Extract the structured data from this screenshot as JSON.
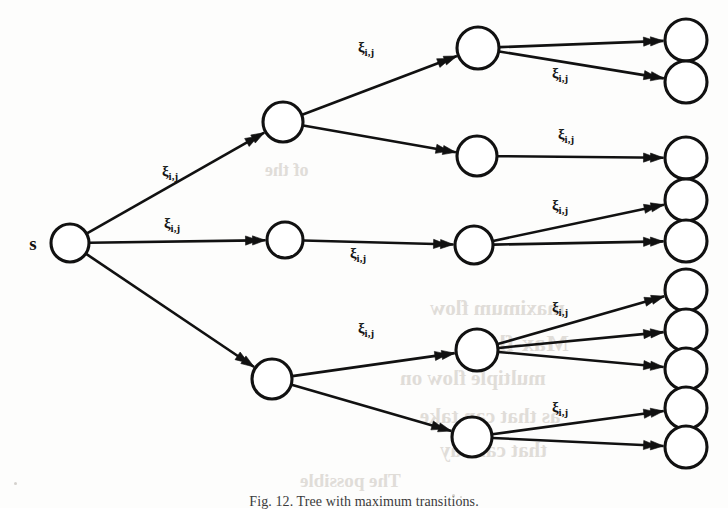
{
  "figure": {
    "kind": "directed-tree-diagram",
    "caption": "Fig. 12. Tree with maximum transitions.",
    "source_label": "s",
    "edge_label_base": "ξ",
    "edge_label_subscript": "i,j",
    "ink_color": "#111111",
    "background_color": "#fdfdfc",
    "node_fill": "#ffffff"
  },
  "graph": {
    "levels": [
      {
        "name": "source",
        "node_count": 1
      },
      {
        "name": "level-1",
        "node_count": 3
      },
      {
        "name": "level-2",
        "node_count": 5
      },
      {
        "name": "leaves",
        "node_count": 9
      }
    ],
    "nodes": [
      {
        "id": "s",
        "level": 0,
        "cx": 70,
        "cy": 243,
        "r": 19
      },
      {
        "id": "a1",
        "level": 1,
        "cx": 283,
        "cy": 122,
        "r": 20
      },
      {
        "id": "a2",
        "level": 1,
        "cx": 285,
        "cy": 240,
        "r": 18
      },
      {
        "id": "a3",
        "level": 1,
        "cx": 272,
        "cy": 379,
        "r": 20
      },
      {
        "id": "b1",
        "level": 2,
        "cx": 478,
        "cy": 48,
        "r": 21
      },
      {
        "id": "b2",
        "level": 2,
        "cx": 477,
        "cy": 156,
        "r": 20
      },
      {
        "id": "b3",
        "level": 2,
        "cx": 474,
        "cy": 245,
        "r": 19
      },
      {
        "id": "b4",
        "level": 2,
        "cx": 477,
        "cy": 350,
        "r": 21
      },
      {
        "id": "b5",
        "level": 2,
        "cx": 472,
        "cy": 437,
        "r": 20
      },
      {
        "id": "c1",
        "level": 3,
        "cx": 686,
        "cy": 40,
        "r": 21
      },
      {
        "id": "c2",
        "level": 3,
        "cx": 686,
        "cy": 82,
        "r": 21
      },
      {
        "id": "c3",
        "level": 3,
        "cx": 686,
        "cy": 158,
        "r": 21
      },
      {
        "id": "c4",
        "level": 3,
        "cx": 686,
        "cy": 200,
        "r": 21
      },
      {
        "id": "c5",
        "level": 3,
        "cx": 686,
        "cy": 241,
        "r": 21
      },
      {
        "id": "c6",
        "level": 3,
        "cx": 686,
        "cy": 290,
        "r": 21
      },
      {
        "id": "c7",
        "level": 3,
        "cx": 686,
        "cy": 330,
        "r": 21
      },
      {
        "id": "c8",
        "level": 3,
        "cx": 686,
        "cy": 369,
        "r": 21
      },
      {
        "id": "c9",
        "level": 3,
        "cx": 686,
        "cy": 408,
        "r": 21
      },
      {
        "id": "c10",
        "level": 3,
        "cx": 686,
        "cy": 447,
        "r": 21
      }
    ],
    "edges": [
      {
        "from": "s",
        "to": "a1",
        "labeled": true
      },
      {
        "from": "s",
        "to": "a2",
        "labeled": true
      },
      {
        "from": "s",
        "to": "a3",
        "labeled": false
      },
      {
        "from": "a1",
        "to": "b1",
        "labeled": true
      },
      {
        "from": "a1",
        "to": "b2",
        "labeled": false
      },
      {
        "from": "a2",
        "to": "b3",
        "labeled": true
      },
      {
        "from": "a3",
        "to": "b4",
        "labeled": true
      },
      {
        "from": "a3",
        "to": "b5",
        "labeled": false
      },
      {
        "from": "b1",
        "to": "c1",
        "labeled": false
      },
      {
        "from": "b1",
        "to": "c2",
        "labeled": true
      },
      {
        "from": "b2",
        "to": "c3",
        "labeled": true
      },
      {
        "from": "b3",
        "to": "c4",
        "labeled": true
      },
      {
        "from": "b3",
        "to": "c5",
        "labeled": false
      },
      {
        "from": "b4",
        "to": "c6",
        "labeled": true
      },
      {
        "from": "b4",
        "to": "c7",
        "labeled": false
      },
      {
        "from": "b4",
        "to": "c8",
        "labeled": false
      },
      {
        "from": "b5",
        "to": "c9",
        "labeled": true
      },
      {
        "from": "b5",
        "to": "c10",
        "labeled": false
      }
    ],
    "edge_labels": [
      {
        "id": "lbl-s-a1",
        "x": 170,
        "y": 176
      },
      {
        "id": "lbl-s-a2",
        "x": 172,
        "y": 228
      },
      {
        "id": "lbl-a1-b1",
        "x": 366,
        "y": 52
      },
      {
        "id": "lbl-b1-c2",
        "x": 560,
        "y": 78
      },
      {
        "id": "lbl-b2-c3",
        "x": 566,
        "y": 139
      },
      {
        "id": "lbl-a2-b3",
        "x": 358,
        "y": 258
      },
      {
        "id": "lbl-b3-c4",
        "x": 560,
        "y": 210
      },
      {
        "id": "lbl-a3-b4",
        "x": 366,
        "y": 333
      },
      {
        "id": "lbl-b4-c6",
        "x": 560,
        "y": 312
      },
      {
        "id": "lbl-b5-c9",
        "x": 560,
        "y": 412
      }
    ]
  },
  "bleed_through": {
    "note": "faint mirrored text showing through from the reverse page side",
    "lines": [
      {
        "text": "maximum flow",
        "x": 430,
        "y": 296,
        "size": 21
      },
      {
        "text": "Max-flow",
        "x": 470,
        "y": 330,
        "size": 24
      },
      {
        "text": "multiple flow on",
        "x": 400,
        "y": 366,
        "size": 21
      },
      {
        "text": "as that can take",
        "x": 420,
        "y": 404,
        "size": 21
      },
      {
        "text": "that can say",
        "x": 440,
        "y": 438,
        "size": 21
      },
      {
        "text": "The possible",
        "x": 300,
        "y": 470,
        "size": 19
      },
      {
        "text": "of the",
        "x": 265,
        "y": 160,
        "size": 18
      }
    ]
  }
}
